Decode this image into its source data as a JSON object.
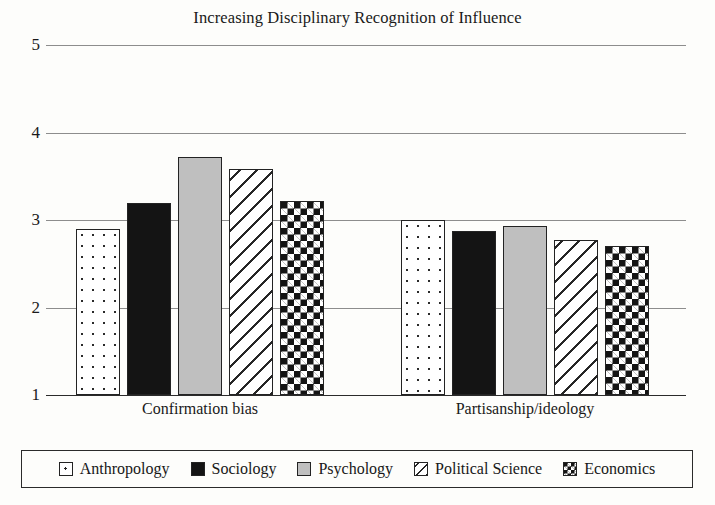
{
  "chart_data": {
    "type": "bar",
    "title": "Increasing Disciplinary Recognition of Influence",
    "xlabel": "",
    "ylabel": "",
    "categories": [
      "Confirmation bias",
      "Partisanship/ideology"
    ],
    "series": [
      {
        "name": "Anthropology",
        "pattern": "dots",
        "values": [
          2.9,
          3.0
        ]
      },
      {
        "name": "Sociology",
        "pattern": "solid-black",
        "values": [
          3.2,
          2.87
        ]
      },
      {
        "name": "Psychology",
        "pattern": "solid-gray",
        "values": [
          3.72,
          2.93
        ]
      },
      {
        "name": "Political Science",
        "pattern": "hatch",
        "values": [
          3.58,
          2.77
        ]
      },
      {
        "name": "Economics",
        "pattern": "check",
        "values": [
          3.22,
          2.7
        ]
      }
    ],
    "ylim": [
      1,
      5
    ],
    "yticks": [
      1,
      2,
      3,
      4,
      5
    ],
    "ytick_labels": [
      "1",
      "2",
      "3",
      "4",
      "5"
    ],
    "grid": true,
    "legend_position": "bottom",
    "legend_entries": [
      "Anthropology",
      "Sociology",
      "Psychology",
      "Political Science",
      "Economics"
    ],
    "colors": {
      "axis": "#2b2b2b",
      "gridline": "#8d8d8d",
      "bar_outline": "#232323",
      "black_fill": "#141414",
      "gray_fill": "#bfbfbf",
      "background": "#fdfdfb"
    }
  }
}
